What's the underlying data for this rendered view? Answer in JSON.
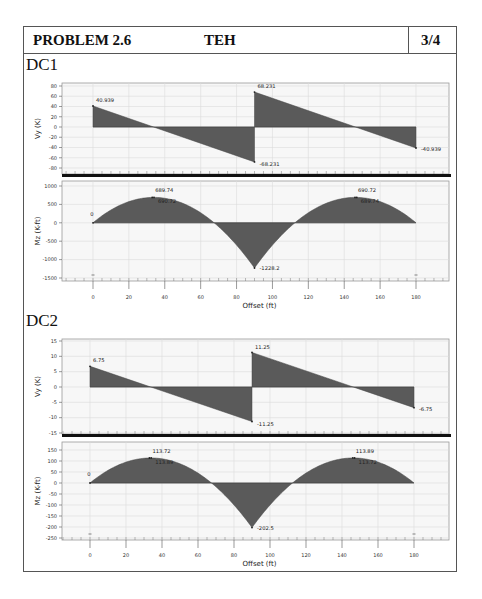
{
  "header": {
    "problem": "PROBLEM 2.6",
    "initials": "TEH",
    "page": "3/4"
  },
  "cases": [
    {
      "label": "DC1",
      "shear": {
        "ylabel": "Vy (K)",
        "yticks": [
          "80",
          "60",
          "40",
          "20",
          "0",
          "-20",
          "-40",
          "-60",
          "-80"
        ],
        "annotations": [
          "40.939",
          "68.231",
          "-68.231",
          "-40.939"
        ]
      },
      "moment": {
        "ylabel": "Mz (K-ft)",
        "yticks": [
          "1000",
          "500",
          "0",
          "-500",
          "-1000",
          "-1500"
        ],
        "annotations": [
          "0",
          "689.74",
          "690.72",
          "690.72",
          "689.74",
          "-1228.2"
        ],
        "xlabel": "Offset (ft)",
        "xticks": [
          "0",
          "20",
          "40",
          "60",
          "80",
          "100",
          "120",
          "140",
          "160",
          "180"
        ]
      }
    },
    {
      "label": "DC2",
      "shear": {
        "ylabel": "Vy (K)",
        "yticks": [
          "15",
          "10",
          "5",
          "0",
          "-5",
          "-10",
          "-15"
        ],
        "annotations": [
          "6.75",
          "11.25",
          "-11.25",
          "-6.75"
        ]
      },
      "moment": {
        "ylabel": "Mz (K-ft)",
        "yticks": [
          "150",
          "100",
          "50",
          "0",
          "-50",
          "-100",
          "-150",
          "-200",
          "-250"
        ],
        "annotations": [
          "0",
          "113.72",
          "113.89",
          "113.89",
          "113.72",
          "-202.5"
        ],
        "xlabel": "Offset (ft)",
        "xticks": [
          "0",
          "20",
          "40",
          "60",
          "80",
          "100",
          "120",
          "140",
          "160",
          "180"
        ]
      }
    }
  ],
  "colors": {
    "fill": "#5a5a5a",
    "grid": "#dcdcdc",
    "plot_bg": "#f7f7f7",
    "axis_bar": "#111111"
  },
  "chart_data": [
    {
      "type": "area",
      "title": "DC1 Shear",
      "xlabel": "Offset (ft)",
      "ylabel": "Vy (K)",
      "ylim": [
        -80,
        80
      ],
      "xlim": [
        0,
        180
      ],
      "grid": true,
      "series": [
        {
          "name": "Vy",
          "x": [
            0,
            90,
            90,
            180
          ],
          "y": [
            40.939,
            -68.231,
            68.231,
            -40.939
          ]
        }
      ],
      "annotations": [
        {
          "x": 0,
          "y": 40.939,
          "text": "40.939"
        },
        {
          "x": 90,
          "y": 68.231,
          "text": "68.231"
        },
        {
          "x": 90,
          "y": -68.231,
          "text": "-68.231"
        },
        {
          "x": 180,
          "y": -40.939,
          "text": "-40.939"
        }
      ]
    },
    {
      "type": "area",
      "title": "DC1 Moment",
      "xlabel": "Offset (ft)",
      "ylabel": "Mz (K-ft)",
      "ylim": [
        -1500,
        1000
      ],
      "xlim": [
        0,
        180
      ],
      "grid": true,
      "series": [
        {
          "name": "Mz",
          "x": [
            0,
            33.75,
            67.5,
            90,
            112.5,
            146.25,
            180
          ],
          "y": [
            0,
            690.72,
            0,
            -1228.2,
            0,
            690.72,
            0
          ]
        }
      ],
      "annotations": [
        {
          "x": 0,
          "y": 0,
          "text": "0"
        },
        {
          "x": 33,
          "y": 689.74,
          "text": "689.74"
        },
        {
          "x": 34,
          "y": 690.72,
          "text": "690.72"
        },
        {
          "x": 146,
          "y": 690.72,
          "text": "690.72"
        },
        {
          "x": 147,
          "y": 689.74,
          "text": "689.74"
        },
        {
          "x": 90,
          "y": -1228.2,
          "text": "-1228.2"
        }
      ]
    },
    {
      "type": "area",
      "title": "DC2 Shear",
      "xlabel": "Offset (ft)",
      "ylabel": "Vy (K)",
      "ylim": [
        -15,
        15
      ],
      "xlim": [
        0,
        180
      ],
      "grid": true,
      "series": [
        {
          "name": "Vy",
          "x": [
            0,
            90,
            90,
            180
          ],
          "y": [
            6.75,
            -11.25,
            11.25,
            -6.75
          ]
        }
      ],
      "annotations": [
        {
          "x": 0,
          "y": 6.75,
          "text": "6.75"
        },
        {
          "x": 90,
          "y": 11.25,
          "text": "11.25"
        },
        {
          "x": 90,
          "y": -11.25,
          "text": "-11.25"
        },
        {
          "x": 180,
          "y": -6.75,
          "text": "-6.75"
        }
      ]
    },
    {
      "type": "area",
      "title": "DC2 Moment",
      "xlabel": "Offset (ft)",
      "ylabel": "Mz (K-ft)",
      "ylim": [
        -250,
        150
      ],
      "xlim": [
        0,
        180
      ],
      "grid": true,
      "series": [
        {
          "name": "Mz",
          "x": [
            0,
            33.75,
            67.5,
            90,
            112.5,
            146.25,
            180
          ],
          "y": [
            0,
            113.89,
            0,
            -202.5,
            0,
            113.89,
            0
          ]
        }
      ],
      "annotations": [
        {
          "x": 0,
          "y": 0,
          "text": "0"
        },
        {
          "x": 33,
          "y": 113.72,
          "text": "113.72"
        },
        {
          "x": 34,
          "y": 113.89,
          "text": "113.89"
        },
        {
          "x": 146,
          "y": 113.89,
          "text": "113.89"
        },
        {
          "x": 147,
          "y": 113.72,
          "text": "113.72"
        },
        {
          "x": 90,
          "y": -202.5,
          "text": "-202.5"
        }
      ]
    }
  ]
}
